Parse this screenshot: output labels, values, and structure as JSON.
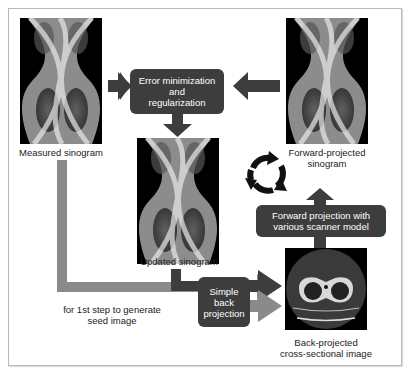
{
  "diagram": {
    "nodes": {
      "measured_sinogram": {
        "label": "Measured sinogram"
      },
      "forward_projected_sinogram": {
        "label_line1": "Forward-projected",
        "label_line2": "sinogram"
      },
      "updated_sinogram": {
        "label": "Updated sinogram"
      },
      "back_projected_image": {
        "label_line1": "Back-projected",
        "label_line2": "cross-sectional image"
      }
    },
    "process_boxes": {
      "error_minimization": {
        "line1": "Error minimization",
        "line2": "and",
        "line3": "regularization"
      },
      "simple_back_projection": {
        "line1": "Simple",
        "line2": "back",
        "line3": "projection"
      },
      "forward_projection": {
        "line1": "Forward projection with",
        "line2": "various scanner model"
      }
    },
    "annotations": {
      "seed_note_line1": "for 1st step to generate",
      "seed_note_line2": "seed image"
    },
    "icons": {
      "cycle": "cycle-arrows-icon"
    },
    "colors": {
      "box_fill": "#3d3d3d",
      "arrow_dark": "#3d3d3d",
      "arrow_gray": "#8a8a8a",
      "frame_border": "#b8b8b8"
    }
  }
}
